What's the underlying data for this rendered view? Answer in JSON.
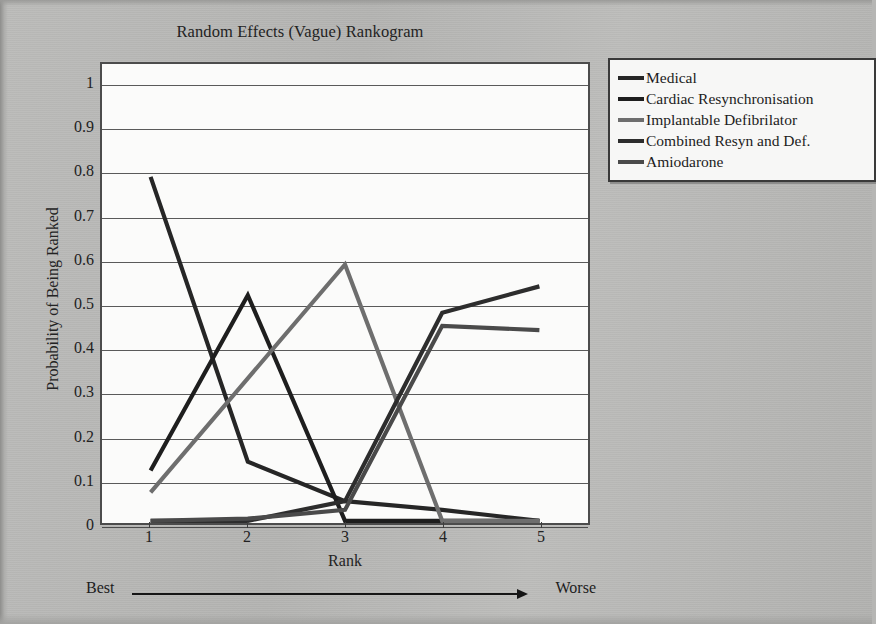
{
  "figure": {
    "title": "Random Effects (Vague) Rankogram",
    "background_color": "#b6b6b4",
    "plot_background_color": "#fbfbfa",
    "gridline_color": "#5a5a5a",
    "axis_color": "#4c4c4c"
  },
  "axes": {
    "y_title": "Probability of Being Ranked",
    "x_title": "Rank",
    "y_ticks": [
      "0",
      "0.1",
      "0.2",
      "0.3",
      "0.4",
      "0.5",
      "0.6",
      "0.7",
      "0.8",
      "0.9",
      "1"
    ],
    "x_ticks": [
      "1",
      "2",
      "3",
      "4",
      "5"
    ]
  },
  "annotation": {
    "left_label": "Best",
    "right_label": "Worse",
    "arrow_icon": "right-arrow-icon"
  },
  "legend": {
    "items": [
      {
        "label": "Medical",
        "color": "#262626"
      },
      {
        "label": "Cardiac Resynchronisation",
        "color": "#1e1e1e"
      },
      {
        "label": "Implantable Defibrilator",
        "color": "#6e6e6e"
      },
      {
        "label": "Combined Resyn and Def.",
        "color": "#2d2d2d"
      },
      {
        "label": "Amiodarone",
        "color": "#4a4a4a"
      }
    ]
  },
  "chart_data": {
    "type": "line",
    "title": "Random Effects (Vague) Rankogram",
    "xlabel": "Rank",
    "ylabel": "Probability of Being Ranked",
    "x": [
      1,
      2,
      3,
      4,
      5
    ],
    "categories": [
      "1",
      "2",
      "3",
      "4",
      "5"
    ],
    "xlim": [
      0.5,
      5.5
    ],
    "ylim": [
      0,
      1
    ],
    "ytick_step": 0.1,
    "grid": "horizontal",
    "legend_position": "right-outside",
    "annotations": [
      {
        "text": "Best",
        "position": "below-axis-left"
      },
      {
        "text": "Worse",
        "position": "below-axis-right"
      }
    ],
    "series": [
      {
        "name": "Medical",
        "color": "#262626",
        "values": [
          0.79,
          0.14,
          0.05,
          0.03,
          0.005
        ]
      },
      {
        "name": "Cardiac Resynchronisation",
        "color": "#1e1e1e",
        "values": [
          0.12,
          0.52,
          0.005,
          0.005,
          0.005
        ]
      },
      {
        "name": "Implantable Defibrilator",
        "color": "#6e6e6e",
        "values": [
          0.07,
          0.33,
          0.59,
          0.005,
          0.005
        ]
      },
      {
        "name": "Combined Resyn and Def.",
        "color": "#2d2d2d",
        "values": [
          0.005,
          0.005,
          0.05,
          0.48,
          0.54
        ]
      },
      {
        "name": "Amiodarone",
        "color": "#4a4a4a",
        "values": [
          0.005,
          0.01,
          0.03,
          0.45,
          0.44
        ]
      }
    ]
  }
}
